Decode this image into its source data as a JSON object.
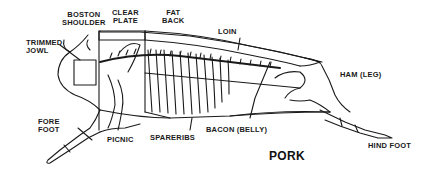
{
  "title": "PORK",
  "labels": {
    "boston_shoulder": [
      "BOSTON",
      "SHOULDER"
    ],
    "clear_plate": [
      "CLEAR",
      "PLATE"
    ],
    "fat_back": [
      "FAT",
      "BACK"
    ],
    "loin": "LOIN",
    "trimmed_jowl": [
      "TRIMMED",
      "JOWL"
    ],
    "ham": "HAM (LEG)",
    "fore_foot": [
      "FORE",
      "FOOT"
    ],
    "picnic": "PICNIC",
    "spareribs": "SPARERIBS",
    "bacon": "BACON (BELLY)",
    "hind_foot": "HIND FOOT"
  },
  "colors": {
    "ink": "#1a1a1a",
    "background": "#ffffff"
  }
}
